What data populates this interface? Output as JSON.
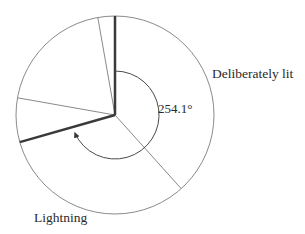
{
  "chart_data": {
    "type": "pie",
    "title": "",
    "categories": [
      "Deliberately lit",
      "Lightning"
    ],
    "values": [
      254.1,
      105.9
    ],
    "units": "degrees",
    "annotation": "254.1°",
    "slice_boundaries_deg_clockwise_from_top": [
      0,
      138,
      254.1,
      280,
      350
    ],
    "sub_slices_deg": [
      138,
      116.1,
      25.9,
      70,
      10
    ],
    "emphasized_boundaries_deg": [
      0,
      254.1
    ],
    "labels": {
      "deliberate": "Deliberately lit",
      "lightning": "Lightning",
      "angle": "254.1°"
    }
  },
  "colors": {
    "outline": "#8a8a8a",
    "emphasis": "#3a3a3a",
    "text": "#2a2a2a"
  }
}
